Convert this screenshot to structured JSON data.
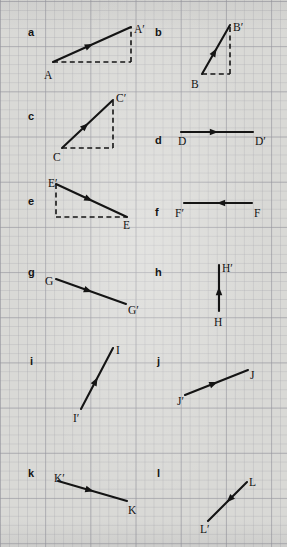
{
  "page": {
    "header_text": "Translation Vectors",
    "width": 287,
    "height": 547,
    "background_color": "#d9d9d6",
    "grid_line_color": "#96969e",
    "ink_color": "#141414"
  },
  "panels": [
    {
      "id": "a",
      "letter": "a",
      "letter_pos": [
        28,
        27
      ],
      "vector": {
        "from": [
          53,
          62
        ],
        "to": [
          131,
          27
        ]
      },
      "arrow_at_midpoint": true,
      "legs": [
        {
          "type": "horizontal",
          "from": [
            53,
            62
          ],
          "to": [
            131,
            62
          ]
        },
        {
          "type": "vertical",
          "from": [
            131,
            62
          ],
          "to": [
            131,
            27
          ]
        }
      ],
      "labels": [
        {
          "text": "A",
          "pos": [
            44,
            70
          ]
        },
        {
          "text": "A′",
          "pos": [
            134,
            24
          ]
        }
      ]
    },
    {
      "id": "b",
      "letter": "b",
      "letter_pos": [
        155,
        27
      ],
      "vector": {
        "from": [
          202,
          74
        ],
        "to": [
          230,
          25
        ]
      },
      "arrow_at_midpoint": true,
      "legs": [
        {
          "type": "horizontal",
          "from": [
            202,
            74
          ],
          "to": [
            230,
            74
          ]
        },
        {
          "type": "vertical",
          "from": [
            230,
            74
          ],
          "to": [
            230,
            25
          ]
        }
      ],
      "labels": [
        {
          "text": "B",
          "pos": [
            191,
            79
          ]
        },
        {
          "text": "B′",
          "pos": [
            233,
            22
          ]
        }
      ]
    },
    {
      "id": "c",
      "letter": "c",
      "letter_pos": [
        28,
        111
      ],
      "vector": {
        "from": [
          62,
          148
        ],
        "to": [
          113,
          100
        ]
      },
      "arrow_at_midpoint": true,
      "legs": [
        {
          "type": "horizontal",
          "from": [
            62,
            148
          ],
          "to": [
            113,
            148
          ]
        },
        {
          "type": "vertical",
          "from": [
            113,
            148
          ],
          "to": [
            113,
            100
          ]
        }
      ],
      "labels": [
        {
          "text": "C",
          "pos": [
            53,
            152
          ]
        },
        {
          "text": "C′",
          "pos": [
            116,
            93
          ]
        }
      ]
    },
    {
      "id": "d",
      "letter": "d",
      "letter_pos": [
        155,
        135
      ],
      "vector": {
        "from": [
          181,
          132
        ],
        "to": [
          253,
          132
        ]
      },
      "arrow_at_midpoint": true,
      "legs": [],
      "labels": [
        {
          "text": "D",
          "pos": [
            178,
            136
          ]
        },
        {
          "text": "D′",
          "pos": [
            255,
            136
          ]
        }
      ]
    },
    {
      "id": "e",
      "letter": "e",
      "letter_pos": [
        28,
        196
      ],
      "vector": {
        "from": [
          56,
          184
        ],
        "to": [
          127,
          217
        ]
      },
      "arrow_at_midpoint": true,
      "legs": [
        {
          "type": "vertical",
          "from": [
            56,
            184
          ],
          "to": [
            56,
            217
          ]
        },
        {
          "type": "horizontal",
          "from": [
            56,
            217
          ],
          "to": [
            127,
            217
          ]
        }
      ],
      "labels": [
        {
          "text": "E′",
          "pos": [
            48,
            178
          ]
        },
        {
          "text": "E",
          "pos": [
            123,
            220
          ]
        }
      ]
    },
    {
      "id": "f",
      "letter": "f",
      "letter_pos": [
        155,
        207
      ],
      "vector": {
        "from": [
          252,
          203
        ],
        "to": [
          184,
          203
        ]
      },
      "arrow_at_midpoint": true,
      "legs": [],
      "labels": [
        {
          "text": "F′",
          "pos": [
            175,
            208
          ]
        },
        {
          "text": "F",
          "pos": [
            254,
            208
          ]
        }
      ]
    },
    {
      "id": "g",
      "letter": "g",
      "letter_pos": [
        28,
        267
      ],
      "vector": {
        "from": [
          56,
          279
        ],
        "to": [
          126,
          304
        ]
      },
      "arrow_at_midpoint": true,
      "legs": [],
      "labels": [
        {
          "text": "G",
          "pos": [
            45,
            276
          ]
        },
        {
          "text": "G′",
          "pos": [
            128,
            305
          ]
        }
      ]
    },
    {
      "id": "h",
      "letter": "h",
      "letter_pos": [
        155,
        267
      ],
      "vector": {
        "from": [
          219,
          311
        ],
        "to": [
          219,
          265
        ]
      },
      "arrow_at_midpoint": true,
      "legs": [],
      "labels": [
        {
          "text": "H′",
          "pos": [
            222,
            263
          ]
        },
        {
          "text": "H",
          "pos": [
            214,
            317
          ]
        }
      ]
    },
    {
      "id": "i",
      "letter": "i",
      "letter_pos": [
        30,
        356
      ],
      "vector": {
        "from": [
          81,
          409
        ],
        "to": [
          113,
          348
        ]
      },
      "arrow_at_midpoint": true,
      "legs": [],
      "labels": [
        {
          "text": "I",
          "pos": [
            116,
            345
          ]
        },
        {
          "text": "I′",
          "pos": [
            73,
            413
          ]
        }
      ]
    },
    {
      "id": "j",
      "letter": "j",
      "letter_pos": [
        157,
        356
      ],
      "vector": {
        "from": [
          185,
          395
        ],
        "to": [
          248,
          370
        ]
      },
      "arrow_at_midpoint": true,
      "legs": [],
      "labels": [
        {
          "text": "J",
          "pos": [
            250,
            370
          ]
        },
        {
          "text": "J′",
          "pos": [
            177,
            396
          ]
        }
      ]
    },
    {
      "id": "k",
      "letter": "k",
      "letter_pos": [
        28,
        468
      ],
      "vector": {
        "from": [
          58,
          481
        ],
        "to": [
          127,
          501
        ]
      },
      "arrow_at_midpoint": true,
      "legs": [],
      "labels": [
        {
          "text": "K′",
          "pos": [
            54,
            473
          ]
        },
        {
          "text": "K",
          "pos": [
            128,
            505
          ]
        }
      ]
    },
    {
      "id": "l",
      "letter": "l",
      "letter_pos": [
        157,
        468
      ],
      "vector": {
        "from": [
          247,
          482
        ],
        "to": [
          208,
          521
        ]
      },
      "arrow_at_midpoint": true,
      "legs": [],
      "labels": [
        {
          "text": "L",
          "pos": [
            249,
            477
          ]
        },
        {
          "text": "L′",
          "pos": [
            200,
            524
          ]
        }
      ]
    }
  ]
}
